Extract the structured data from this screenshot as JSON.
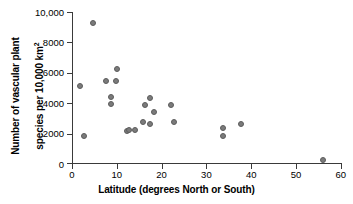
{
  "chart_data": {
    "type": "scatter",
    "title": "",
    "xlabel": "Latitude (degrees North or South)",
    "ylabel": "Number of vascular plant\nspecies per 10,000 km²",
    "ylabel_line1": "Number of vascular plant",
    "ylabel_line2_prefix": "species per 10,000 km",
    "ylabel_line2_sup": "2",
    "xlim": [
      0,
      60
    ],
    "ylim": [
      0,
      10000
    ],
    "xticks": [
      0,
      10,
      20,
      30,
      40,
      50,
      60
    ],
    "xtick_labels": [
      "0",
      "10",
      "20",
      "30",
      "40",
      "50",
      "60"
    ],
    "yticks": [
      0,
      2000,
      4000,
      6000,
      8000,
      10000
    ],
    "ytick_labels": [
      "0",
      "2000",
      "4000",
      "6000",
      "8000",
      "10,000"
    ],
    "grid": false,
    "legend": null,
    "marker_color": "#7b7b7b",
    "marker_edge_color": "#5c5c5c",
    "axis_color": "#3a3a3a",
    "background": "#ffffff",
    "points": [
      {
        "x": 1.7,
        "y": 5100
      },
      {
        "x": 2.7,
        "y": 1800
      },
      {
        "x": 4.6,
        "y": 9300
      },
      {
        "x": 7.7,
        "y": 5400
      },
      {
        "x": 8.8,
        "y": 4400
      },
      {
        "x": 8.8,
        "y": 3900
      },
      {
        "x": 9.9,
        "y": 5450
      },
      {
        "x": 10.1,
        "y": 6250
      },
      {
        "x": 12.3,
        "y": 2150
      },
      {
        "x": 12.8,
        "y": 2200
      },
      {
        "x": 14.0,
        "y": 2200
      },
      {
        "x": 15.8,
        "y": 2700
      },
      {
        "x": 16.4,
        "y": 3850
      },
      {
        "x": 17.3,
        "y": 2600
      },
      {
        "x": 17.5,
        "y": 4300
      },
      {
        "x": 18.2,
        "y": 3350
      },
      {
        "x": 22.0,
        "y": 3850
      },
      {
        "x": 22.7,
        "y": 2700
      },
      {
        "x": 33.7,
        "y": 2300
      },
      {
        "x": 33.7,
        "y": 1800
      },
      {
        "x": 37.8,
        "y": 2550
      },
      {
        "x": 56.0,
        "y": 200
      }
    ]
  }
}
